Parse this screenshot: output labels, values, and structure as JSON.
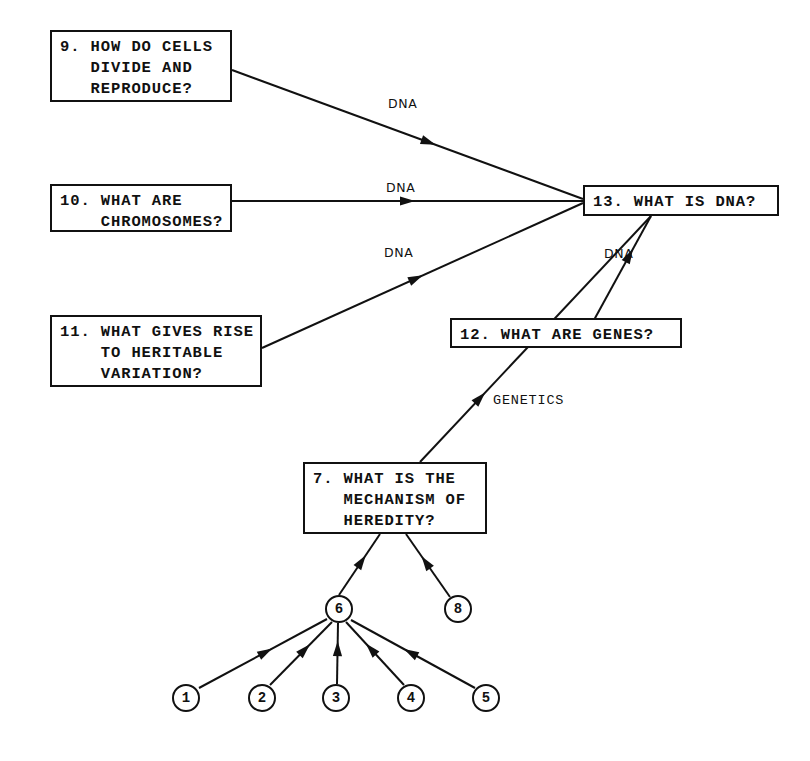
{
  "diagram": {
    "stroke_color": "#111111",
    "background_color": "#ffffff",
    "width": 810,
    "height": 761
  },
  "boxes": [
    {
      "id": "q9",
      "number": "9.",
      "text": "9. HOW DO CELLS\n   DIVIDE AND\n   REPRODUCE?",
      "x": 50,
      "y": 30,
      "w": 182,
      "h": 72
    },
    {
      "id": "q10",
      "number": "10.",
      "text": "10. WHAT ARE\n    CHROMOSOMES?",
      "x": 50,
      "y": 184,
      "w": 182,
      "h": 48
    },
    {
      "id": "q11",
      "number": "11.",
      "text": "11. WHAT GIVES RISE\n    TO HERITABLE\n    VARIATION?",
      "x": 50,
      "y": 315,
      "w": 212,
      "h": 72
    },
    {
      "id": "q12",
      "number": "12.",
      "text": "12. WHAT ARE GENES?",
      "x": 450,
      "y": 318,
      "w": 232,
      "h": 30
    },
    {
      "id": "q13",
      "number": "13.",
      "text": "13. WHAT IS DNA?",
      "x": 583,
      "y": 185,
      "w": 196,
      "h": 31
    },
    {
      "id": "q7",
      "number": "7.",
      "text": "7. WHAT IS THE\n   MECHANISM OF\n   HEREDITY?",
      "x": 303,
      "y": 462,
      "w": 184,
      "h": 72
    }
  ],
  "circles": [
    {
      "id": "c1",
      "label": "1",
      "cx": 186,
      "cy": 698
    },
    {
      "id": "c2",
      "label": "2",
      "cx": 262,
      "cy": 698
    },
    {
      "id": "c3",
      "label": "3",
      "cx": 336,
      "cy": 698
    },
    {
      "id": "c4",
      "label": "4",
      "cx": 411,
      "cy": 698
    },
    {
      "id": "c5",
      "label": "5",
      "cx": 486,
      "cy": 698
    },
    {
      "id": "c6",
      "label": "6",
      "cx": 339,
      "cy": 609
    },
    {
      "id": "c8",
      "label": "8",
      "cx": 458,
      "cy": 609
    }
  ],
  "edges": [
    {
      "id": "e9-13",
      "from": "q9",
      "to": "q13",
      "x1": 232,
      "y1": 70,
      "x2": 583,
      "y2": 199,
      "arrow_t": 0.56
    },
    {
      "id": "e10-13",
      "from": "q10",
      "to": "q13",
      "x1": 232,
      "y1": 201,
      "x2": 583,
      "y2": 201,
      "arrow_t": 0.5
    },
    {
      "id": "e11-13",
      "from": "q11",
      "to": "q13",
      "x1": 262,
      "y1": 348,
      "x2": 583,
      "y2": 203,
      "arrow_t": 0.48
    },
    {
      "id": "e12-13",
      "from": "q12",
      "to": "q13",
      "x1": 594,
      "y1": 320,
      "x2": 651,
      "y2": 216,
      "arrow_t": 0.62
    },
    {
      "id": "e7-13",
      "from": "q7",
      "to": "q13",
      "x1": 420,
      "y1": 462,
      "x2": 651,
      "y2": 216,
      "arrow_t": 0.26
    },
    {
      "id": "e6-7",
      "from": "c6",
      "to": "q7",
      "x1": 339,
      "y1": 595,
      "x2": 380,
      "y2": 534,
      "arrow_t": 0.55
    },
    {
      "id": "e8-7",
      "from": "c8",
      "to": "q7",
      "x1": 450,
      "y1": 597,
      "x2": 406,
      "y2": 534,
      "arrow_t": 0.55
    },
    {
      "id": "e1-6",
      "from": "c1",
      "to": "c6",
      "x1": 199,
      "y1": 688,
      "x2": 327,
      "y2": 619,
      "arrow_t": 0.52
    },
    {
      "id": "e2-6",
      "from": "c2",
      "to": "c6",
      "x1": 270,
      "y1": 685,
      "x2": 332,
      "y2": 622,
      "arrow_t": 0.56
    },
    {
      "id": "e3-6",
      "from": "c3",
      "to": "c6",
      "x1": 337,
      "y1": 684,
      "x2": 338,
      "y2": 623,
      "arrow_t": 0.58
    },
    {
      "id": "e4-6",
      "from": "c4",
      "to": "c6",
      "x1": 404,
      "y1": 685,
      "x2": 346,
      "y2": 622,
      "arrow_t": 0.57
    },
    {
      "id": "e5-6",
      "from": "c5",
      "to": "c6",
      "x1": 475,
      "y1": 688,
      "x2": 351,
      "y2": 620,
      "arrow_t": 0.52
    }
  ],
  "edge_labels": [
    {
      "id": "lbl-dna-1",
      "text": "DNA",
      "x": 388,
      "y": 96,
      "style": "sans"
    },
    {
      "id": "lbl-dna-2",
      "text": "DNA",
      "x": 386,
      "y": 180,
      "style": "sans"
    },
    {
      "id": "lbl-dna-3",
      "text": "DNA",
      "x": 384,
      "y": 245,
      "style": "sans"
    },
    {
      "id": "lbl-dna-4",
      "text": "DNA",
      "x": 604,
      "y": 246,
      "style": "sans"
    },
    {
      "id": "lbl-genetics",
      "text": "GENETICS",
      "x": 493,
      "y": 393,
      "style": "mono"
    }
  ]
}
